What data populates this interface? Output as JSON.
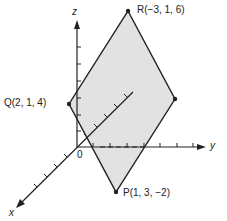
{
  "diagram": {
    "axes": {
      "x": "x",
      "y": "y",
      "z": "z",
      "origin": "0"
    },
    "points": {
      "R": "R(−3, 1, 6)",
      "Q": "Q(2, 1, 4)",
      "P": "P(1, 3, −2)"
    },
    "fill_color": "#e0e0e0",
    "stroke_color": "#222222"
  }
}
